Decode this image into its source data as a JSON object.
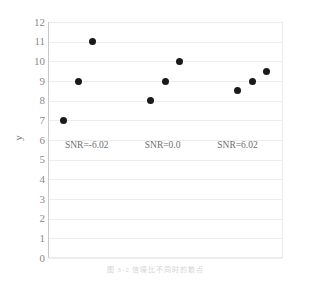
{
  "chart_data": {
    "type": "scatter",
    "title": "",
    "xlabel": "",
    "ylabel": "y",
    "ylim": [
      0,
      12
    ],
    "yticks": [
      12,
      11,
      10,
      9,
      8,
      7,
      6,
      5,
      4,
      3,
      2,
      1,
      0
    ],
    "grid": true,
    "legend": "none",
    "xaxis_visible": false,
    "series": [
      {
        "name": "SNR=-6.02",
        "points": [
          {
            "x": 1,
            "y": 7
          },
          {
            "x": 2,
            "y": 9
          },
          {
            "x": 3,
            "y": 11
          }
        ]
      },
      {
        "name": "SNR=0.0",
        "points": [
          {
            "x": 7,
            "y": 8
          },
          {
            "x": 8,
            "y": 9
          },
          {
            "x": 9,
            "y": 10
          }
        ]
      },
      {
        "name": "SNR=6.02",
        "points": [
          {
            "x": 13,
            "y": 8.5
          },
          {
            "x": 14,
            "y": 9
          },
          {
            "x": 15,
            "y": 9.5
          }
        ]
      }
    ],
    "annotations": [
      {
        "text": "SNR=-6.02",
        "x": 1.1,
        "y": 5.7
      },
      {
        "text": "SNR=0.0",
        "x": 6.6,
        "y": 5.7
      },
      {
        "text": "SNR=6.02",
        "x": 11.6,
        "y": 5.7
      }
    ],
    "marker_color": "#1a1a1a",
    "gridline_color": "#ededed",
    "tick_label_color": "#8a8a8a"
  },
  "caption": {
    "text": "图 3-2  信噪比不同时的散点"
  }
}
